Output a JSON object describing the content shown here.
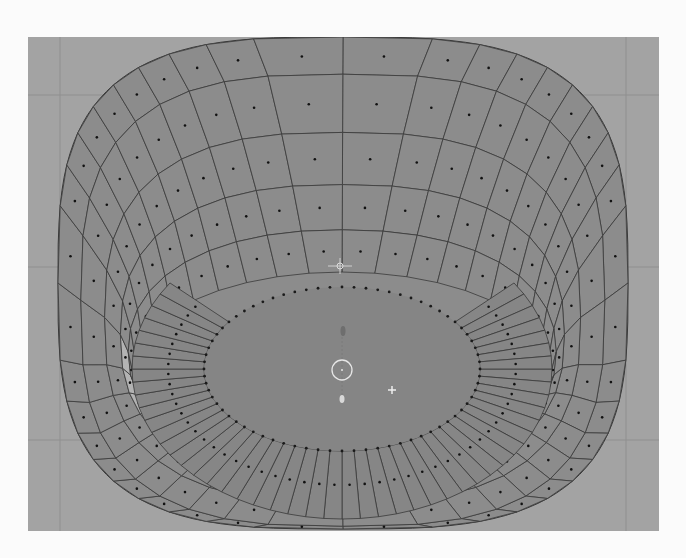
{
  "viewport": {
    "mode": "Edit Mode",
    "select_mode": "Face",
    "object": "Ring mesh",
    "colors": {
      "background": "#a3a3a3",
      "grid": "#8f8f8f",
      "face": "#8c8c8c",
      "face_floor": "#868686",
      "face_selected": "#b3b3b3",
      "edge": "#3a3a3a",
      "face_dot": "#111111",
      "cursor": "#e6e6e6"
    },
    "grid_lines": {
      "vertical_x": [
        32,
        598
      ],
      "horizontal_y": [
        58,
        230,
        403
      ]
    },
    "mesh": {
      "outer": {
        "cx": 315,
        "cy": 246,
        "rx": 285,
        "ry": 246,
        "squareness": 3.2
      },
      "rim_loops": [
        {
          "rx": 285,
          "ry": 246
        },
        {
          "rx": 262,
          "ry": 226
        },
        {
          "rx": 238,
          "ry": 185
        },
        {
          "rx": 222,
          "ry": 150
        },
        {
          "rx": 214,
          "ry": 122
        },
        {
          "rx": 210,
          "ry": 97
        }
      ],
      "rim_segments": 40,
      "floor": {
        "cx": 314,
        "cy": 332,
        "rx": 210,
        "ry": 150
      },
      "hole": {
        "cx": 314,
        "cy": 332,
        "rx": 138,
        "ry": 82
      },
      "floor_spokes": 72,
      "selected_faces": [
        {
          "loop": 3,
          "segment": 26
        },
        {
          "loop": 3,
          "segment": 27
        },
        {
          "loop": 3,
          "segment": 28
        },
        {
          "loop": 3,
          "segment": 29
        }
      ]
    },
    "pivot": {
      "x": 312,
      "y": 229
    },
    "cursor_3d": {
      "x": 314,
      "y": 333,
      "r": 10
    },
    "origin_marker": {
      "x": 315,
      "y": 294
    },
    "origin_dot": {
      "x": 314,
      "y": 362
    },
    "plus_marker": {
      "x": 364,
      "y": 353
    }
  }
}
